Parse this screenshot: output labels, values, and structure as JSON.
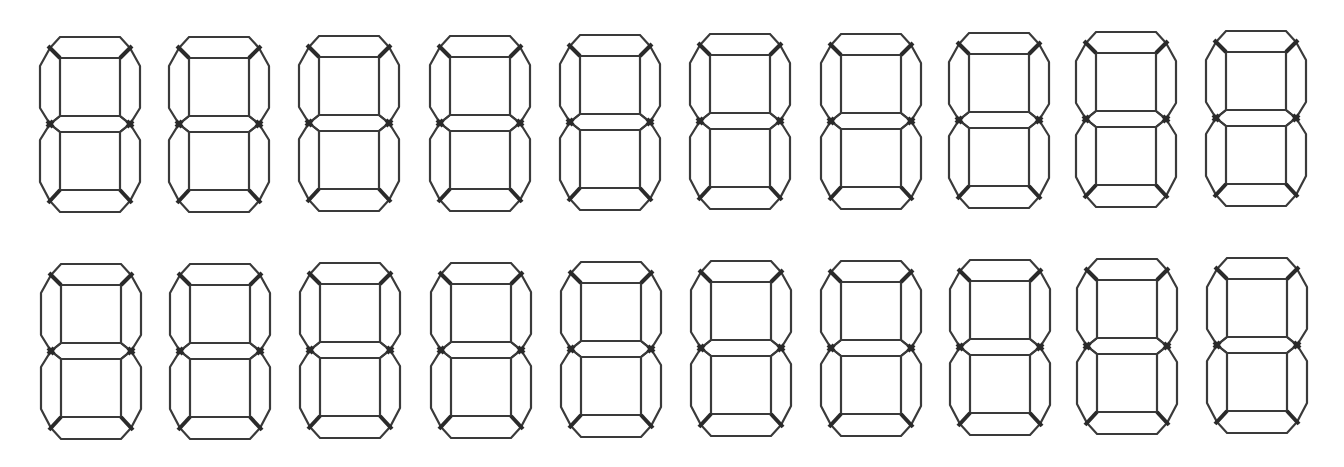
{
  "figure": {
    "stroke_color": "#3a3a3a",
    "background": "#ffffff",
    "digit_size": {
      "width": 100,
      "height": 175
    },
    "rows": [
      {
        "name": "top-row",
        "digits": [
          {
            "x": 40,
            "y": 37
          },
          {
            "x": 169,
            "y": 37
          },
          {
            "x": 299,
            "y": 36
          },
          {
            "x": 430,
            "y": 36
          },
          {
            "x": 560,
            "y": 35
          },
          {
            "x": 690,
            "y": 34
          },
          {
            "x": 821,
            "y": 34
          },
          {
            "x": 949,
            "y": 33
          },
          {
            "x": 1076,
            "y": 32
          },
          {
            "x": 1206,
            "y": 31
          }
        ]
      },
      {
        "name": "bottom-row",
        "digits": [
          {
            "x": 41,
            "y": 264
          },
          {
            "x": 170,
            "y": 264
          },
          {
            "x": 300,
            "y": 263
          },
          {
            "x": 431,
            "y": 263
          },
          {
            "x": 561,
            "y": 262
          },
          {
            "x": 691,
            "y": 261
          },
          {
            "x": 821,
            "y": 261
          },
          {
            "x": 950,
            "y": 260
          },
          {
            "x": 1077,
            "y": 259
          },
          {
            "x": 1207,
            "y": 258
          }
        ]
      }
    ],
    "segments": [
      "a-top",
      "b-top-right",
      "c-bottom-right",
      "d-bottom",
      "e-bottom-left",
      "f-top-left",
      "g-middle"
    ]
  }
}
